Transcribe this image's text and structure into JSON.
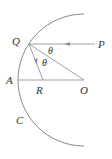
{
  "diagram": {
    "labels": {
      "Q": "Q",
      "P": "P",
      "A": "A",
      "R": "R",
      "O": "O",
      "C": "C",
      "theta_upper": "θ",
      "theta_lower": "θ"
    },
    "points": {
      "O": [
        84,
        80
      ],
      "Q": [
        29,
        44
      ],
      "P": [
        97,
        44
      ],
      "A": [
        18,
        80
      ],
      "R": [
        43,
        80
      ]
    },
    "mirror": {
      "center": [
        84,
        80
      ],
      "radius": 66,
      "start": [
        84,
        14
      ],
      "end": [
        84,
        147
      ]
    },
    "colors": {
      "line": "#8a8a8a",
      "text": "#333333",
      "background": "#ffffff"
    }
  }
}
